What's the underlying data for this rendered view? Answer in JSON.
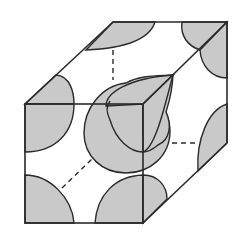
{
  "diagram": {
    "title": "Body-centered cubic unit cell",
    "colors": {
      "background": "#ffffff",
      "line": "#2a2a2a",
      "atom_fill": "#c9c9c9"
    },
    "cube": {
      "front_face": {
        "x1": 25,
        "y1": 104,
        "x2": 143,
        "y2": 223
      },
      "depth_offset": {
        "dx": 84,
        "dy": -81
      }
    },
    "atoms": [
      {
        "id": "center",
        "label": "body-center atom"
      },
      {
        "id": "corner-front-top-left",
        "label": "corner atom"
      },
      {
        "id": "corner-front-bottom-left",
        "label": "corner atom"
      },
      {
        "id": "corner-front-bottom-right",
        "label": "corner atom"
      },
      {
        "id": "corner-front-top-right",
        "label": "corner atom"
      },
      {
        "id": "corner-back-top-left",
        "label": "corner atom"
      },
      {
        "id": "corner-back-top-right",
        "label": "corner atom"
      },
      {
        "id": "corner-back-bottom-right",
        "label": "corner atom"
      }
    ]
  }
}
